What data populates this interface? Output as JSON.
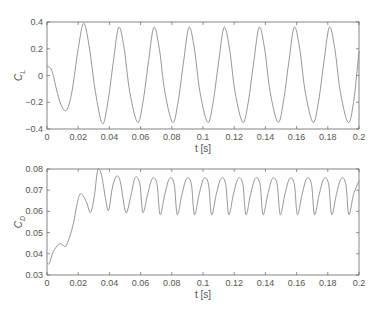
{
  "figure": {
    "width": 383,
    "height": 313,
    "line_color": "#8a8a8a",
    "axis_color": "#666666",
    "text_color": "#555555"
  },
  "chart_data": [
    {
      "type": "line",
      "title": "",
      "xlabel": "t [s]",
      "ylabel": "C_L",
      "ylabel_main": "C",
      "ylabel_sub": "L",
      "xlim": [
        0,
        0.2
      ],
      "ylim": [
        -0.4,
        0.4
      ],
      "xticks": [
        0,
        0.02,
        0.04,
        0.06,
        0.08,
        0.1,
        0.12,
        0.14,
        0.16,
        0.18,
        0.2
      ],
      "xtick_labels": [
        "0",
        "0.02",
        "0.04",
        "0.06",
        "0.08",
        "0.1",
        "0.12",
        "0.14",
        "0.16",
        "0.18",
        "0.2"
      ],
      "yticks": [
        -0.4,
        -0.2,
        0,
        0.2,
        0.4
      ],
      "ytick_labels": [
        "−0.4",
        "−0.2",
        "0",
        "0.2",
        "0.4"
      ],
      "grid": false,
      "legend": null,
      "series": [
        {
          "name": "C_L",
          "x": [
            0,
            0.003,
            0.006,
            0.009,
            0.0125,
            0.016,
            0.02,
            0.0235,
            0.027,
            0.031,
            0.0355,
            0.039,
            0.0425,
            0.046,
            0.0495,
            0.053,
            0.058,
            0.0615,
            0.065,
            0.0685,
            0.072,
            0.0755,
            0.0805,
            0.084,
            0.0875,
            0.091,
            0.0945,
            0.098,
            0.103,
            0.1065,
            0.11,
            0.1135,
            0.117,
            0.1205,
            0.1255,
            0.129,
            0.1325,
            0.136,
            0.1395,
            0.143,
            0.148,
            0.1515,
            0.155,
            0.1585,
            0.162,
            0.1655,
            0.1705,
            0.174,
            0.1775,
            0.181,
            0.1845,
            0.188,
            0.193,
            0.1965,
            0.2
          ],
          "y": [
            0.07,
            0.04,
            -0.1,
            -0.22,
            -0.26,
            -0.12,
            0.2,
            0.39,
            0.22,
            -0.12,
            -0.36,
            -0.2,
            0.1,
            0.36,
            0.2,
            -0.12,
            -0.35,
            -0.2,
            0.1,
            0.36,
            0.2,
            -0.12,
            -0.35,
            -0.2,
            0.1,
            0.36,
            0.2,
            -0.12,
            -0.35,
            -0.2,
            0.1,
            0.36,
            0.2,
            -0.12,
            -0.35,
            -0.2,
            0.1,
            0.36,
            0.2,
            -0.12,
            -0.35,
            -0.2,
            0.1,
            0.36,
            0.2,
            -0.12,
            -0.35,
            -0.2,
            0.1,
            0.36,
            0.2,
            -0.12,
            -0.35,
            -0.2,
            0.18
          ]
        }
      ]
    },
    {
      "type": "line",
      "title": "",
      "xlabel": "t [s]",
      "ylabel": "C_D",
      "ylabel_main": "C",
      "ylabel_sub": "D",
      "xlim": [
        0,
        0.2
      ],
      "ylim": [
        0.03,
        0.08
      ],
      "xticks": [
        0,
        0.02,
        0.04,
        0.06,
        0.08,
        0.1,
        0.12,
        0.14,
        0.16,
        0.18,
        0.2
      ],
      "xtick_labels": [
        "0",
        "0.02",
        "0.04",
        "0.06",
        "0.08",
        "0.1",
        "0.12",
        "0.14",
        "0.16",
        "0.18",
        "0.2"
      ],
      "yticks": [
        0.03,
        0.04,
        0.05,
        0.06,
        0.07,
        0.08
      ],
      "ytick_labels": [
        "0.03",
        "0.04",
        "0.05",
        "0.06",
        "0.07",
        "0.08"
      ],
      "grid": false,
      "legend": null,
      "series": [
        {
          "name": "C_D",
          "x": [
            0,
            0.0015,
            0.004,
            0.0075,
            0.0095,
            0.012,
            0.0145,
            0.017,
            0.019,
            0.021,
            0.023,
            0.0255,
            0.028,
            0.0305,
            0.0325,
            0.035,
            0.0375,
            0.0395,
            0.042,
            0.0445,
            0.047,
            0.0505,
            0.0535,
            0.0565,
            0.0595,
            0.0615,
            0.0645,
            0.0675,
            0.0705,
            0.0725,
            0.0755,
            0.0785,
            0.0815,
            0.0835,
            0.0865,
            0.0895,
            0.0925,
            0.0945,
            0.0975,
            0.1005,
            0.1035,
            0.1055,
            0.1085,
            0.1115,
            0.1145,
            0.1165,
            0.1195,
            0.1225,
            0.1255,
            0.1275,
            0.1305,
            0.1335,
            0.1365,
            0.1385,
            0.1415,
            0.1445,
            0.1475,
            0.1495,
            0.1525,
            0.1555,
            0.1585,
            0.1605,
            0.1635,
            0.1665,
            0.1695,
            0.1715,
            0.1745,
            0.1775,
            0.1805,
            0.1825,
            0.1855,
            0.1885,
            0.1915,
            0.1935,
            0.1965,
            0.2
          ],
          "y": [
            0.0355,
            0.0355,
            0.041,
            0.0445,
            0.0445,
            0.0435,
            0.048,
            0.0545,
            0.0625,
            0.068,
            0.0675,
            0.064,
            0.0595,
            0.068,
            0.0795,
            0.077,
            0.066,
            0.0605,
            0.0715,
            0.0765,
            0.074,
            0.0595,
            0.0665,
            0.076,
            0.073,
            0.0595,
            0.068,
            0.0755,
            0.073,
            0.0585,
            0.068,
            0.0755,
            0.073,
            0.0585,
            0.068,
            0.0755,
            0.073,
            0.0585,
            0.068,
            0.0755,
            0.073,
            0.0585,
            0.068,
            0.0755,
            0.073,
            0.0585,
            0.068,
            0.0755,
            0.073,
            0.0585,
            0.068,
            0.0755,
            0.073,
            0.0585,
            0.068,
            0.0755,
            0.073,
            0.0585,
            0.068,
            0.0755,
            0.073,
            0.0585,
            0.068,
            0.0755,
            0.073,
            0.0585,
            0.068,
            0.0755,
            0.073,
            0.0585,
            0.068,
            0.0755,
            0.073,
            0.0585,
            0.068,
            0.0745
          ]
        }
      ]
    }
  ],
  "layout": {
    "panels": [
      {
        "left": 47,
        "top": 22,
        "width": 312,
        "height": 107
      },
      {
        "left": 47,
        "top": 169,
        "width": 312,
        "height": 106
      }
    ]
  }
}
